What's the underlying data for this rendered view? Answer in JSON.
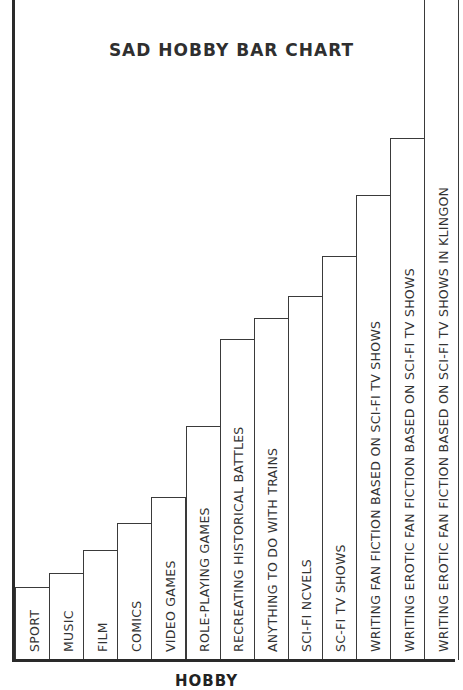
{
  "chart_data": {
    "type": "bar",
    "title": "SAD HOBBY BAR CHART",
    "xlabel": "HOBBY",
    "ylabel": "",
    "grid": false,
    "legend": null,
    "categories": [
      "SPORT",
      "MUSIC",
      "FILM",
      "COMICS",
      "VIDEO GAMES",
      "ROLE-PLAYING GAMES",
      "RECREATING HISTORICAL BATTLES",
      "ANYTHING TO DO WITH TRAINS",
      "SCI-FI NCVELS",
      "SC-FI TV SHOWS",
      "WRITING FAN FICTION BASED ON SCI-FI TV SHOWS",
      "WRITING EROTIC FAN FICTION BASED ON SCI-FI TV SHOWS",
      "WRITING EROTIC FAN FICTION BASED ON SCI-FI TV SHOWS IN KLINGON"
    ],
    "values": [
      73,
      87,
      110,
      137,
      163,
      234,
      321,
      342,
      364,
      404,
      465,
      522,
      680
    ],
    "ylim": [
      0,
      680
    ]
  },
  "chart": {
    "title": "SAD HOBBY BAR CHART",
    "xlabel": "HOBBY"
  }
}
